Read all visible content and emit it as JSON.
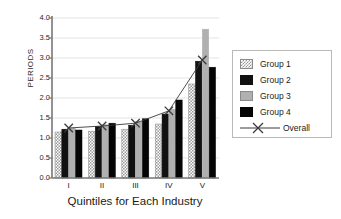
{
  "chart_data": {
    "type": "bar",
    "title": "",
    "xlabel": "Quintiles for Each Industry",
    "ylabel": "PERIODS",
    "categories": [
      "I",
      "II",
      "III",
      "IV",
      "V"
    ],
    "ylim": [
      0.0,
      4.0
    ],
    "ytick_labels": [
      "0.0",
      "0.5",
      "1.0",
      "1.5",
      "2.0",
      "2.5",
      "3.0",
      "3.5",
      "4.0"
    ],
    "ytick_values": [
      0.0,
      0.5,
      1.0,
      1.5,
      2.0,
      2.5,
      3.0,
      3.5,
      4.0
    ],
    "grid": true,
    "legend_position": "right",
    "series": [
      {
        "name": "Group 1",
        "values": [
          1.15,
          1.17,
          1.22,
          1.35,
          2.35
        ],
        "fill": "checker",
        "color": "#9a9a9a"
      },
      {
        "name": "Group 2",
        "values": [
          1.22,
          1.29,
          1.32,
          1.6,
          2.92
        ],
        "fill": "solid",
        "color": "#111111"
      },
      {
        "name": "Group 3",
        "values": [
          1.25,
          1.33,
          1.41,
          1.72,
          3.72
        ],
        "fill": "solid",
        "color": "#b0b0b0"
      },
      {
        "name": "Group 4",
        "values": [
          1.2,
          1.37,
          1.48,
          1.95,
          2.77
        ],
        "fill": "solid",
        "color": "#050505"
      }
    ],
    "overline": {
      "name": "Overall",
      "values": [
        1.25,
        1.3,
        1.37,
        1.68,
        2.95
      ],
      "marker": "x",
      "color": "#3a3a3a"
    }
  },
  "legend": {
    "entries": [
      {
        "label": "Group 1"
      },
      {
        "label": "Group 2"
      },
      {
        "label": "Group 3"
      },
      {
        "label": "Group 4"
      },
      {
        "label": "Overall"
      }
    ]
  }
}
